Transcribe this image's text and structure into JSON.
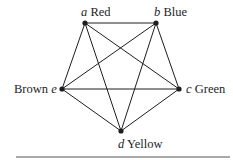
{
  "diagram": {
    "type": "complete-graph",
    "nodes": [
      {
        "id": "a",
        "letter": "a",
        "color_label": "Red",
        "x": 85,
        "y": 23
      },
      {
        "id": "b",
        "letter": "b",
        "color_label": "Blue",
        "x": 156,
        "y": 23
      },
      {
        "id": "c",
        "letter": "c",
        "color_label": "Green",
        "x": 179,
        "y": 89
      },
      {
        "id": "d",
        "letter": "d",
        "color_label": "Yellow",
        "x": 121,
        "y": 131
      },
      {
        "id": "e",
        "letter": "e",
        "color_label": "Brown",
        "x": 62,
        "y": 89
      }
    ],
    "edges": [
      [
        "a",
        "b"
      ],
      [
        "a",
        "c"
      ],
      [
        "a",
        "d"
      ],
      [
        "a",
        "e"
      ],
      [
        "b",
        "c"
      ],
      [
        "b",
        "d"
      ],
      [
        "b",
        "e"
      ],
      [
        "c",
        "d"
      ],
      [
        "c",
        "e"
      ],
      [
        "d",
        "e"
      ]
    ],
    "line_color": "#1e1e1e"
  }
}
